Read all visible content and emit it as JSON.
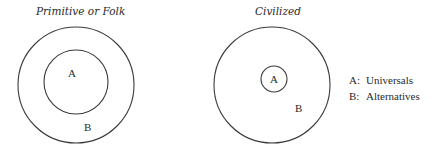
{
  "diagrams": [
    {
      "title": "Primitive or Folk",
      "inner_label": "A",
      "outer_label": "B"
    },
    {
      "title": "Civilized",
      "inner_label": "A",
      "outer_label": "B"
    }
  ],
  "legend": [
    {
      "key": "A:",
      "text": "Universals"
    },
    {
      "key": "B:",
      "text": "Alternatives"
    }
  ],
  "colors": {
    "stroke": "#3a3a3a",
    "text": "#2a2a2a",
    "background": "#ffffff"
  }
}
